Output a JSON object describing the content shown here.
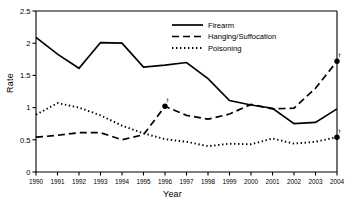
{
  "chart_data": {
    "type": "line",
    "title": "",
    "xlabel": "Year",
    "ylabel": "Rate",
    "x": [
      1990,
      1991,
      1992,
      1993,
      1994,
      1995,
      1996,
      1997,
      1998,
      1999,
      2000,
      2001,
      2002,
      2003,
      2004
    ],
    "xtick_labels": [
      "1990",
      "1991",
      "1992",
      "1993",
      "1994",
      "1995",
      "1996",
      "1997",
      "1998",
      "1999",
      "2000",
      "2001",
      "2002",
      "2003",
      "2004"
    ],
    "ytick_labels": [
      "0",
      "0.5",
      "1",
      "1.5",
      "2",
      "2.5"
    ],
    "ytick_values": [
      0,
      0.5,
      1,
      1.5,
      2,
      2.5
    ],
    "ylim": [
      0,
      2.5
    ],
    "xlim": [
      1990,
      2004
    ],
    "grid": false,
    "legend_position": "top-center",
    "series": [
      {
        "name": "Firearm",
        "style": "solid",
        "color": "#000000",
        "values": [
          2.09,
          1.83,
          1.61,
          2.01,
          2.0,
          1.63,
          1.66,
          1.7,
          1.45,
          1.11,
          1.04,
          0.99,
          0.75,
          0.77,
          0.98
        ],
        "markers": []
      },
      {
        "name": "Hanging/Suffocation",
        "style": "dashed",
        "color": "#000000",
        "values": [
          0.54,
          0.57,
          0.61,
          0.61,
          0.5,
          0.58,
          1.02,
          0.88,
          0.82,
          0.9,
          1.05,
          0.98,
          0.99,
          1.3,
          1.72
        ],
        "markers": [
          {
            "x": 1996,
            "y": 1.02,
            "annotation": "†"
          },
          {
            "x": 2004,
            "y": 1.72,
            "annotation": "†"
          }
        ]
      },
      {
        "name": "Poisoning",
        "style": "dotted",
        "color": "#000000",
        "values": [
          0.89,
          1.07,
          1.0,
          0.88,
          0.72,
          0.6,
          0.51,
          0.47,
          0.4,
          0.44,
          0.43,
          0.52,
          0.44,
          0.47,
          0.54
        ],
        "markers": [
          {
            "x": 2004,
            "y": 0.54,
            "annotation": "†"
          }
        ]
      }
    ]
  },
  "axes": {
    "y_axis_label": "Rate",
    "x_axis_label": "Year"
  },
  "legend": {
    "items": [
      {
        "label": "Firearm",
        "style": "solid"
      },
      {
        "label": "Hanging/Suffocation",
        "style": "dashed"
      },
      {
        "label": "Poisoning",
        "style": "dotted"
      }
    ]
  }
}
